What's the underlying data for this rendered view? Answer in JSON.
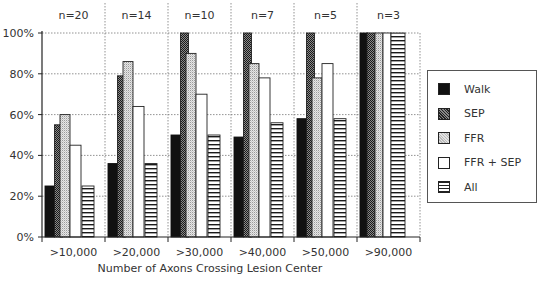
{
  "chart_data": {
    "type": "bar",
    "title": "",
    "xlabel": "Number of Axons Crossing Lesion Center",
    "ylabel": "",
    "ylim": [
      0,
      100
    ],
    "yticks": [
      "0%",
      "20%",
      "40%",
      "60%",
      "80%",
      "100%"
    ],
    "grid": true,
    "legend_position": "right",
    "categories": [
      ">10,000",
      ">20,000",
      ">30,000",
      ">40,000",
      ">50,000",
      ">90,000"
    ],
    "group_annotations": [
      "n=20",
      "n=14",
      "n=10",
      "n=7",
      "n=5",
      "n=3"
    ],
    "series": [
      {
        "name": "Walk",
        "pattern": "solid-black",
        "values": [
          25,
          36,
          50,
          49,
          58,
          100
        ]
      },
      {
        "name": "SEP",
        "pattern": "dark-stipple",
        "values": [
          55,
          79,
          100,
          100,
          100,
          100
        ]
      },
      {
        "name": "FFR",
        "pattern": "light-stipple",
        "values": [
          60,
          86,
          90,
          85,
          78,
          100
        ]
      },
      {
        "name": "FFR + SEP",
        "pattern": "white",
        "values": [
          45,
          64,
          70,
          78,
          85,
          100
        ]
      },
      {
        "name": "All",
        "pattern": "horizontal-lines",
        "values": [
          25,
          36,
          50,
          56,
          58,
          100
        ]
      }
    ]
  },
  "legend": {
    "items": [
      {
        "label": "Walk",
        "cls": "sw-walk"
      },
      {
        "label": "SEP",
        "cls": "sw-sep"
      },
      {
        "label": "FFR",
        "cls": "sw-ffr"
      },
      {
        "label": "FFR + SEP",
        "cls": "sw-ffrsep"
      },
      {
        "label": "All",
        "cls": "sw-all"
      }
    ]
  },
  "colors": {
    "axis": "#222222",
    "grid": "#777777",
    "text": "#333333"
  }
}
